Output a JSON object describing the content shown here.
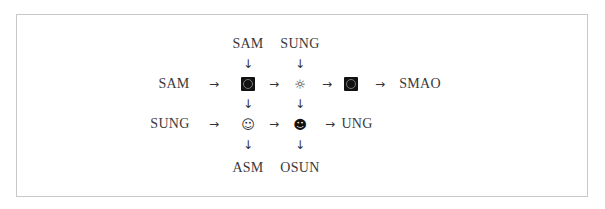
{
  "diagram": {
    "top_labels": [
      {
        "id": "top-col1",
        "text": "SAM"
      },
      {
        "id": "top-col2",
        "text": "SUNG"
      }
    ],
    "row1": {
      "input_label": "SAM",
      "output_label": "SMAO",
      "nodes": [
        {
          "id": "r1c1",
          "icon": "black-square-circle-icon"
        },
        {
          "id": "r1c2",
          "icon": "sun-icon",
          "glyph": "☼"
        },
        {
          "id": "r1c3",
          "icon": "black-square-circle-icon"
        }
      ]
    },
    "row2": {
      "input_label": "SUNG",
      "output_label": "UNG",
      "nodes": [
        {
          "id": "r2c1",
          "icon": "white-smiley-icon",
          "glyph": "☺"
        },
        {
          "id": "r2c2",
          "icon": "black-smiley-icon",
          "glyph": "☻"
        }
      ]
    },
    "bottom_labels": [
      {
        "id": "bottom-col1",
        "text": "ASM"
      },
      {
        "id": "bottom-col2",
        "text": "OSUN"
      }
    ],
    "arrow_right": "→",
    "arrow_down": "↓"
  }
}
